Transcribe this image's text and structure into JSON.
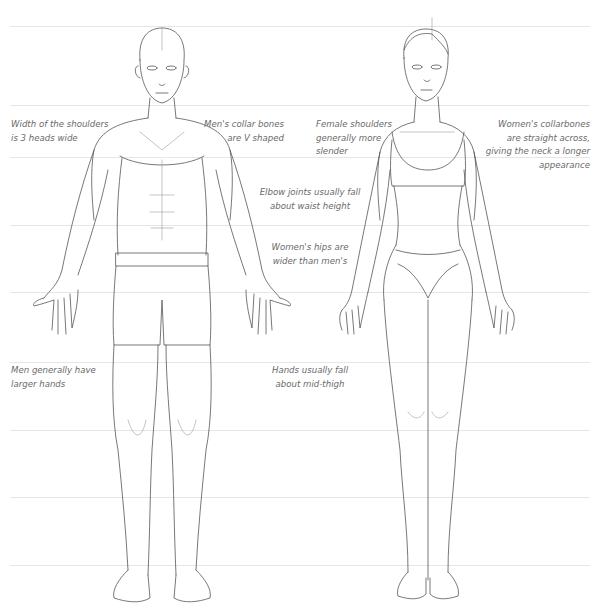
{
  "diagram": {
    "figures": [
      {
        "id": "male",
        "label": "Male figure, front view"
      },
      {
        "id": "female",
        "label": "Female figure, front view"
      }
    ],
    "guidelines_y": [
      26,
      105,
      157,
      225,
      292,
      362,
      430,
      497,
      565
    ],
    "annotations": {
      "shoulder_width": "Width of the shoulders\nis 3 heads wide",
      "male_collarbones": "Men's collar bones\nare V shaped",
      "female_shoulders": "Female shoulders\ngenerally more\nslender",
      "female_collarbones": "Women's collarbones\nare straight across,\ngiving the neck a longer\nappearance",
      "elbow_joints": "Elbow joints usually fall\nabout waist height",
      "female_hips": "Women's hips are\nwider than men's",
      "male_hands": "Men generally have\nlarger hands",
      "hand_position": "Hands usually fall\nabout mid-thigh"
    }
  }
}
